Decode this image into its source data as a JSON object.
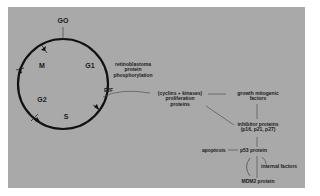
{
  "diagram": {
    "background_color": "#a9a9a9",
    "line_color": "#111111",
    "cycle": {
      "phases": {
        "g0": "GO",
        "m": "M",
        "g1": "G1",
        "g2": "G2",
        "s": "S"
      }
    },
    "labels": {
      "rb_line1": "retinoblastoma",
      "rb_line2": "protein",
      "rb_line3": "phosphorylation",
      "e2f": "E2F",
      "cyclins_line1": "(cyclins + kinases)",
      "cyclins_line2": "proliferation",
      "cyclins_line3": "proteins",
      "growth_line1": "growth mitogenic",
      "growth_line2": "factors",
      "inhibitor_line1": "inhibitor proteins",
      "inhibitor_line2": "(p16, p21, p27)",
      "apoptosis": "apoptosis",
      "p53": "p53 protein",
      "internal": "internal factors",
      "mdm2": "MDM2 protein"
    }
  }
}
